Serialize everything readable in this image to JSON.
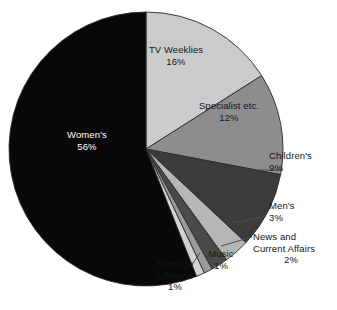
{
  "chart_data": {
    "type": "pie",
    "title": "",
    "subtitle": "",
    "xlabel": "",
    "ylabel": "",
    "legend_position": "none",
    "grid": false,
    "units": "percent",
    "total": 100,
    "start_angle_deg": 0,
    "direction": "clockwise",
    "categories": [
      "TV Weeklies",
      "Specialist etc.",
      "Children's",
      "Men's",
      "News and Current Affairs",
      "Music",
      "Teenage Lifestyle",
      "Women's"
    ],
    "values": [
      16,
      12,
      9,
      3,
      2,
      1,
      1,
      56
    ],
    "slices": [
      {
        "label": "TV Weeklies",
        "value": 16,
        "value_text": "16%",
        "color": "#cbcbcb",
        "label_color": "#161616",
        "label_placement": "inside",
        "has_leader_line": false
      },
      {
        "label": "Specialist etc.",
        "value": 12,
        "value_text": "12%",
        "color": "#8d8d8d",
        "label_color": "#161616",
        "label_placement": "inside",
        "has_leader_line": false
      },
      {
        "label": "Children's",
        "value": 9,
        "value_text": "9%",
        "color": "#3b3b3b",
        "label_color": "#161616",
        "label_placement": "outside",
        "has_leader_line": true
      },
      {
        "label": "Men's",
        "value": 3,
        "value_text": "3%",
        "color": "#b6b6b6",
        "label_color": "#161616",
        "label_placement": "outside",
        "has_leader_line": true
      },
      {
        "label": "News and Current Affairs",
        "value": 2,
        "value_text": "2%",
        "color": "#4a4a4a",
        "label_color": "#161616",
        "label_placement": "outside",
        "has_leader_line": true
      },
      {
        "label": "Music",
        "value": 1,
        "value_text": "1%",
        "color": "#9a9a9a",
        "label_color": "#161616",
        "label_placement": "outside",
        "has_leader_line": true
      },
      {
        "label": "Teenage Lifestyle",
        "value": 1,
        "value_text": "1%",
        "color": "#d2d2d2",
        "label_color": "#161616",
        "label_placement": "outside",
        "has_leader_line": true
      },
      {
        "label": "Women's",
        "value": 56,
        "value_text": "56%",
        "color": "#080808",
        "label_color": "#ffffff",
        "label_placement": "inside",
        "has_leader_line": false
      }
    ],
    "labels": {
      "women_name": "Women's",
      "women_value": "56%",
      "tv_name": "TV Weeklies",
      "tv_value": "16%",
      "specialist_name": "Specialist etc.",
      "specialist_value": "12%",
      "children_name": "Children's",
      "children_value": "9%",
      "men_name": "Men's",
      "men_value": "3%",
      "news_name_line1": "News and",
      "news_name_line2": "Current Affairs",
      "news_value": "2%",
      "music_name": "Music",
      "music_value": "1%",
      "teenage_name_line1": "Teenage",
      "teenage_name_line2": "Lifestyle",
      "teenage_value": "1%"
    },
    "geometry": {
      "center_x": 146,
      "center_y": 149,
      "radius": 137
    },
    "colors": {
      "background": "#ffffff",
      "outline": "#2a2a2a",
      "leader_line": "#4d4d4d",
      "text": "#161616",
      "text_on_dark": "#ffffff"
    }
  }
}
